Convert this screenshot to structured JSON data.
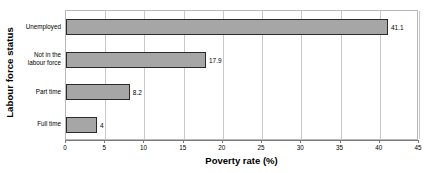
{
  "chart_data": {
    "type": "bar",
    "orientation": "horizontal",
    "title": "",
    "xlabel": "Poverty rate (%)",
    "ylabel": "Labour force status",
    "categories": [
      "Full time",
      "Part time",
      "Not in the labour force",
      "Unemployed"
    ],
    "values": [
      4,
      8.2,
      17.9,
      41.1
    ],
    "value_labels": [
      "4",
      "8.2",
      "17.9",
      "41.1"
    ],
    "xlim": [
      0,
      45
    ],
    "xticks": [
      0,
      5,
      10,
      15,
      20,
      25,
      30,
      35,
      40,
      45
    ],
    "xtick_labels": [
      "0",
      "5",
      "10",
      "15",
      "20",
      "25",
      "30",
      "35",
      "40",
      "45"
    ],
    "grid": "vertical",
    "legend": "none",
    "colors": {
      "bar_fill": "#a6a6a6",
      "bar_border": "#2b2b2b",
      "gridline": "#c9c9c9",
      "axis": "#7a7a7a",
      "plot_border": "#b9b9b9",
      "text": "#000000",
      "background": "#ffffff"
    }
  }
}
